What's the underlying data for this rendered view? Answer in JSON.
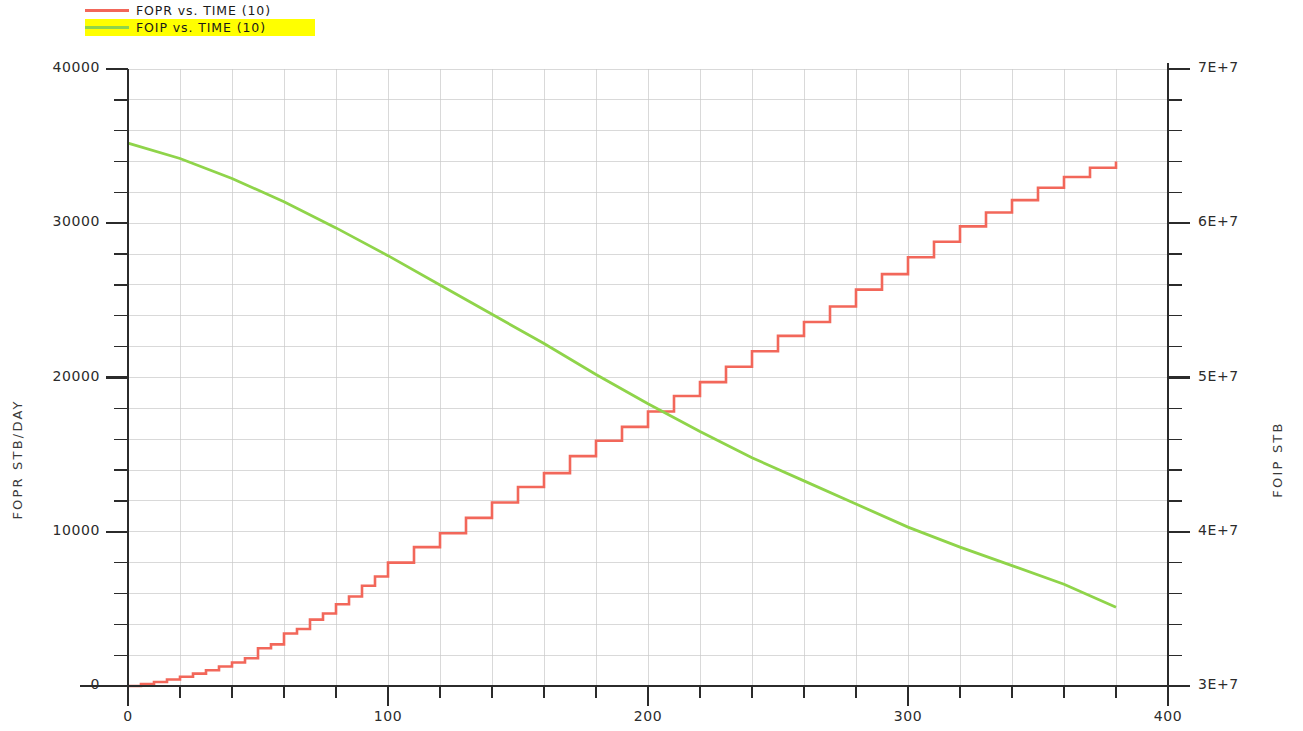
{
  "legend": {
    "position": "top-left",
    "entries": [
      {
        "label": "FOPR  vs.  TIME (10)",
        "color": "#f2675a",
        "highlight": false
      },
      {
        "label": "FOIP  vs.  TIME (10)",
        "color": "#8fd44a",
        "highlight": true,
        "highlight_color": "#ffff00"
      }
    ]
  },
  "axes": {
    "left_title": "FOPR  STB/DAY",
    "right_title": "FOIP  STB",
    "x_title": "",
    "left_ticks": [
      "0",
      "10000",
      "20000",
      "30000",
      "40000"
    ],
    "right_ticks": [
      "3E+7",
      "4E+7",
      "5E+7",
      "6E+7",
      "7E+7"
    ],
    "x_ticks": [
      "0",
      "100",
      "200",
      "300",
      "400"
    ]
  },
  "chart_data": {
    "type": "line",
    "title": "",
    "subtitle": "",
    "xlabel": "",
    "ylabel": "FOPR  STB/DAY",
    "y2label": "FOIP  STB",
    "xlim": [
      0,
      400
    ],
    "ylim": [
      0,
      40000
    ],
    "y2lim": [
      30000000,
      70000000
    ],
    "grid": true,
    "x_major_step": 100,
    "x_minor_step": 20,
    "y_major_step": 10000,
    "y_minor_step": 2000,
    "y2_major_step": 10000000,
    "y2_minor_step": 2000000,
    "legend_position": "top-left",
    "series": [
      {
        "name": "FOPR  vs.  TIME (10)",
        "axis": "left",
        "color": "#f2675a",
        "style": "step",
        "units": "STB/DAY",
        "x": [
          0,
          5,
          10,
          15,
          20,
          25,
          30,
          35,
          40,
          45,
          50,
          55,
          60,
          65,
          70,
          75,
          80,
          85,
          90,
          95,
          100,
          110,
          120,
          130,
          140,
          150,
          160,
          170,
          180,
          190,
          200,
          210,
          220,
          230,
          240,
          250,
          260,
          270,
          280,
          290,
          300,
          310,
          320,
          330,
          340,
          350,
          360,
          370,
          380
        ],
        "y": [
          0,
          120,
          260,
          420,
          600,
          800,
          1020,
          1260,
          1520,
          1800,
          2450,
          2700,
          3400,
          3700,
          4300,
          4700,
          5300,
          5800,
          6500,
          7100,
          8000,
          9000,
          9900,
          10900,
          11900,
          12900,
          13800,
          14900,
          15900,
          16800,
          17800,
          18800,
          19700,
          20700,
          21700,
          22700,
          23600,
          24600,
          25700,
          26700,
          27800,
          28800,
          29800,
          30700,
          31500,
          32300,
          33000,
          33600,
          34000
        ]
      },
      {
        "name": "FOIP  vs.  TIME (10)",
        "axis": "right",
        "color": "#8fd44a",
        "style": "line",
        "units": "STB",
        "x": [
          0,
          20,
          40,
          60,
          80,
          100,
          120,
          140,
          160,
          180,
          200,
          220,
          240,
          260,
          280,
          300,
          320,
          340,
          360,
          380
        ],
        "y": [
          65200000,
          64200000,
          62900000,
          61400000,
          59700000,
          57900000,
          56000000,
          54100000,
          52200000,
          50200000,
          48300000,
          46500000,
          44800000,
          43300000,
          41800000,
          40300000,
          39000000,
          37800000,
          36600000,
          35100000
        ]
      }
    ]
  }
}
